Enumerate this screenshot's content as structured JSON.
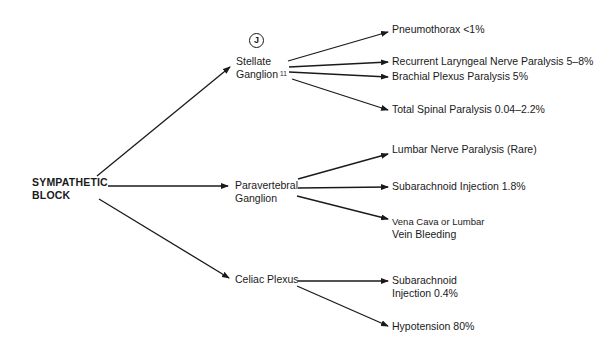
{
  "diagram": {
    "root": {
      "line1": "SYMPATHETIC",
      "line2": "BLOCK"
    },
    "marker": "J",
    "branches": [
      {
        "name": "Stellate Ganglion",
        "line1": "Stellate",
        "line2": "Ganglion",
        "superscript": "11",
        "outcomes": [
          {
            "text": "Pneumothorax <1%"
          },
          {
            "text": "Recurrent Laryngeal Nerve Paralysis 5–8%"
          },
          {
            "text": "Brachial Plexus Paralysis 5%"
          },
          {
            "text": "Total Spinal Paralysis 0.04–2.2%"
          }
        ]
      },
      {
        "name": "Paravertebral Ganglion",
        "line1": "Paravertebral",
        "line2": "Ganglion",
        "outcomes": [
          {
            "text": "Lumbar Nerve Paralysis (Rare)"
          },
          {
            "text": "Subarachnoid Injection 1.8%"
          },
          {
            "line1": "Vena Cava or Lumbar",
            "line2": "Vein Bleeding"
          }
        ]
      },
      {
        "name": "Celiac Plexus",
        "line1": "Celiac Plexus",
        "outcomes": [
          {
            "line1": "Subarachnoid",
            "line2": "Injection 0.4%"
          },
          {
            "text": "Hypotension 80%"
          }
        ]
      }
    ]
  },
  "colors": {
    "ink": "#1a1a1a",
    "background": "#ffffff"
  }
}
